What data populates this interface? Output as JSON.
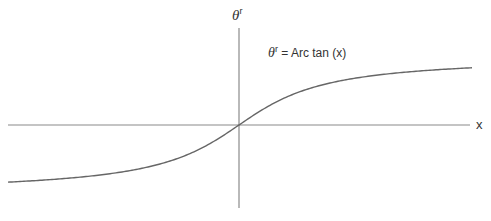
{
  "diagram": {
    "y_axis_label": {
      "symbol": "θ",
      "superscript": "r"
    },
    "x_axis_label": "x",
    "curve_label": {
      "symbol": "θ",
      "superscript": "r",
      "equation": " = Arc tan (x)"
    },
    "curve_function": "arctan",
    "colors": {
      "axis": "#888888",
      "curve": "#666666",
      "text": "#333333"
    }
  }
}
